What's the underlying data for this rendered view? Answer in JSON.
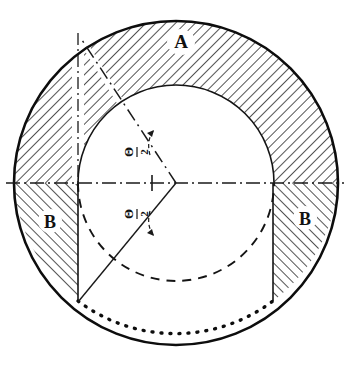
{
  "figure": {
    "background_color": "#ffffff",
    "ink_color": "#111111",
    "width": 348,
    "height": 365
  },
  "labels": {
    "region_a": "A",
    "region_b_left": "B",
    "region_b_right": "B",
    "angle_upper_numerator": "Θ",
    "angle_upper_denominator": "2",
    "angle_upper_bar": "—",
    "angle_lower_numerator": "Θ",
    "angle_lower_denominator": "2",
    "angle_lower_bar": "—"
  },
  "geometry": {
    "center_x": 176,
    "center_y": 183,
    "outer_radius": 162,
    "inner_radius": 98,
    "chord_left_x": 78,
    "chord_right_x": 273,
    "chord_bottom_y": 301,
    "apex_x": 176,
    "apex_y": 183,
    "ray_upper_end_x": 80,
    "ray_upper_end_y": 37,
    "ray_lower_end_x": 78,
    "ray_lower_end_y": 302,
    "hatch_angle_deg": 45,
    "hatch_spacing_px": 7
  },
  "line_styles": {
    "outer_circle": "solid-heavy",
    "inner_circle_upper": "solid-thin",
    "inner_circle_lower": "dashed",
    "centerline_horizontal": "dash-dot",
    "centerline_vertical": "dash-dot",
    "ray_upper": "dash-dot",
    "ray_lower": "solid-thin",
    "bottom_arc": "dotted-heavy",
    "chords": "solid-thin"
  }
}
